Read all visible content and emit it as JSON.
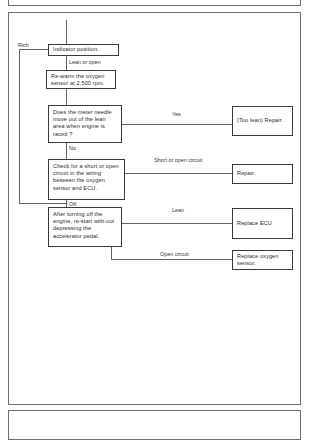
{
  "diagram": {
    "type": "flowchart",
    "nodes": {
      "indicator": "Indicator position.",
      "rewarm": "Re-warm the oxygen sensor at 2,500 rpm.",
      "needle_question": "Does the meter needle move out of the lean area when engine is raced ?",
      "check_circuit": "Check for a short or open circuit in the wiring between the oxygen sensor and ECU.",
      "restart": "After turning off the engine, re-start with-out depressing the accelerator pedal.",
      "too_lean_repair": "(Too lean) Repair.",
      "repair": "Repair.",
      "replace_ecu": "Replace ECU",
      "replace_oxygen_sensor": "Replace oxygen sensor."
    },
    "edge_labels": {
      "rich": "Rich",
      "lean_or_open": "Lean or open",
      "yes": "Yes",
      "no": "No",
      "short_or_open": "Short or open circuit",
      "ok": "OK",
      "lean": "Lean",
      "open_circuit": "Open circuit"
    }
  }
}
